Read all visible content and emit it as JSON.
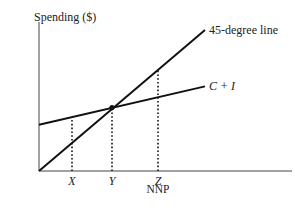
{
  "chart_data": {
    "type": "line",
    "title": "",
    "ylabel": "Spending ($)",
    "xlabel": "NNP",
    "x_ticks": [
      {
        "label": "X",
        "x": 0.33
      },
      {
        "label": "Y",
        "x": 0.73
      },
      {
        "label": "Z",
        "x": 1.19
      }
    ],
    "xlim": [
      0,
      1.66
    ],
    "ylim": [
      0,
      1.4
    ],
    "series": [
      {
        "name": "45-degree line",
        "label": "45-degree line",
        "label_italic": false,
        "points": [
          [
            0,
            0
          ],
          [
            1.66,
            1.4
          ]
        ]
      },
      {
        "name": "C + I",
        "label": "C + I",
        "label_italic": true,
        "points": [
          [
            0,
            0.46
          ],
          [
            1.66,
            0.84
          ]
        ]
      }
    ],
    "equilibrium": {
      "x": 0.73,
      "y": 0.63
    },
    "guides": [
      {
        "at": "X",
        "x": 0.33,
        "to_line": "C + I"
      },
      {
        "at": "Y",
        "x": 0.73,
        "to_line": "both"
      },
      {
        "at": "Z",
        "x": 1.19,
        "to_line": "45-degree line"
      }
    ],
    "colors": {
      "line": "#111111",
      "axis": "#444444"
    }
  }
}
